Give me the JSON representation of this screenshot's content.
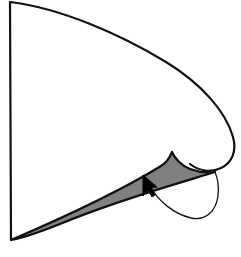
{
  "canvas": {
    "width": 241,
    "height": 257,
    "background_color": "#ffffff",
    "description": "Line drawing of a curved wedge / cone-like geometric figure with a shaded gray sliver and a mouse cursor"
  },
  "palette": {
    "stroke_color": "#111111",
    "shaded_fill": "#808080",
    "unshaded_fill": "#ffffff",
    "cursor_color": "#000000"
  },
  "figure": {
    "apex": {
      "x": 10,
      "y": 2
    },
    "base_vertex": {
      "x": 11,
      "y": 240
    },
    "cusp_point": {
      "x": 172,
      "y": 152
    },
    "rightmost_point": {
      "x": 235,
      "y": 156
    },
    "outline_stroke_width": 2.2,
    "hook_stroke_width": 1.3,
    "outer_curve_path": "M 10 2 C 60 8 120 34 166 62 C 202 84 226 112 233 137 C 237 151 232 163 221 168 C 211 173 199 171 190 164",
    "left_edge_path": "M 10 2 L 11 240",
    "shaded_wedge_path": "M 11 240 C 60 219 122 190 161 166 C 166 163 170 157 172 152 C 175 159 182 166 190 169 C 198 172 208 173 215 172 C 190 180 120 199 60 224 C 40 232 22 238 11 240 Z",
    "hook_arc_path": "M 150 186 C 158 201 174 214 191 218 C 206 221 216 211 218 196 C 219 187 218 179 215 172",
    "cursor": {
      "tip": {
        "x": 143,
        "y": 175
      },
      "path": "M 143 175 L 143 196 L 148 190 L 152 197 L 155 195 L 151 188 L 157 187 Z"
    }
  }
}
